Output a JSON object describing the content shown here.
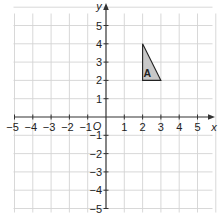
{
  "chart_data": {
    "type": "coordinate-grid",
    "title": "",
    "xlabel": "x",
    "ylabel": "y",
    "origin_label": "O",
    "xlim": [
      -5,
      5
    ],
    "ylim": [
      -5,
      5
    ],
    "grid": true,
    "x_ticks": [
      -5,
      -4,
      -3,
      -2,
      -1,
      1,
      2,
      3,
      4,
      5
    ],
    "y_ticks": [
      5,
      4,
      3,
      2,
      1,
      -1,
      -2,
      -3,
      -4,
      -5
    ],
    "x_tick_labels": [
      "−5",
      "−4",
      "−3",
      "−2",
      "−1",
      "1",
      "2",
      "3",
      "4",
      "5"
    ],
    "y_tick_labels": [
      "5",
      "4",
      "3",
      "2",
      "1",
      "−1",
      "−2",
      "−3",
      "−4",
      "−5"
    ],
    "shapes": [
      {
        "name": "A",
        "type": "triangle",
        "vertices": [
          [
            2,
            4
          ],
          [
            2,
            2
          ],
          [
            3,
            2
          ]
        ],
        "fill": "#c8c8c8",
        "stroke": "#222222"
      }
    ]
  },
  "colors": {
    "grid": "#d4d4d4",
    "axis": "#333333",
    "text": "#222222",
    "shape_fill": "#c8c8c8"
  }
}
